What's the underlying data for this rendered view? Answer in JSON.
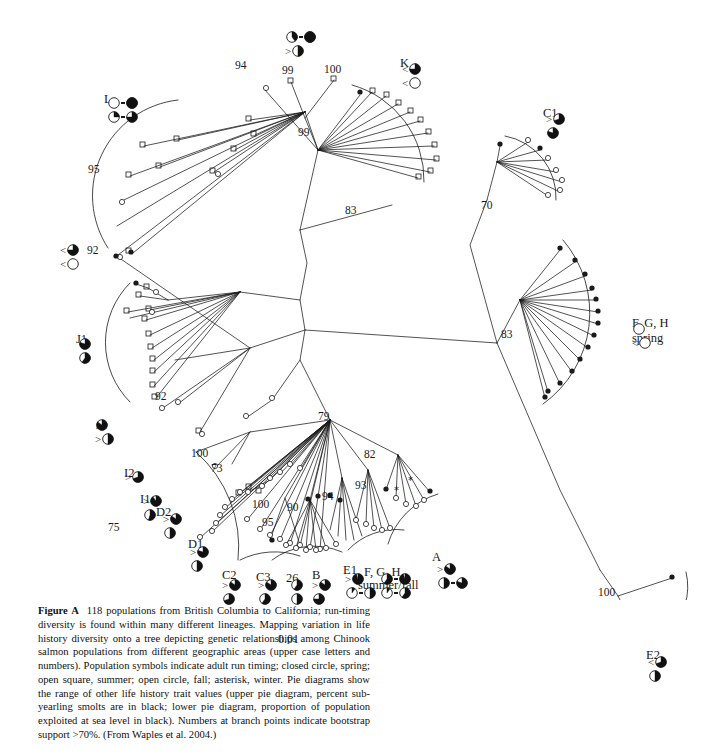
{
  "figure": {
    "label": "Figure A",
    "caption": "118 populations from British Columbia to California; run-timing diversity is found within many different lineages. Mapping variation in life history diversity onto a tree depicting genetic relationships among Chinook salmon populations from different geographic areas (upper case letters and numbers). Population symbols indicate adult run timing; closed circle, spring; open square, summer; open circle, fall; asterisk, winter. Pie diagrams show the range of other life history trait values (upper pie diagram, percent sub-yearling smolts are in black; lower pie diagram, proportion of population exploited at sea level in black). Numbers at branch points indicate bootstrap support >70%. (From Waples et al. 2004.)"
  },
  "scale_bar": {
    "value": "0.01"
  },
  "chart_data": {
    "type": "diagram",
    "subtype": "unrooted-phylogenetic-tree",
    "n_populations": 118,
    "scale_bar": "0.01",
    "bootstrap_threshold": ">70%",
    "symbol_legend": [
      {
        "symbol": "closed circle",
        "meaning": "spring"
      },
      {
        "symbol": "open square",
        "meaning": "summer"
      },
      {
        "symbol": "open circle",
        "meaning": "fall"
      },
      {
        "symbol": "asterisk",
        "meaning": "winter"
      }
    ],
    "pie_legend": [
      {
        "position": "upper pie diagram",
        "meaning": "percent sub-yearling smolts are in black"
      },
      {
        "position": "lower pie diagram",
        "meaning": "proportion of population exploited at sea level in black"
      }
    ],
    "bootstrap_values": [
      94,
      99,
      100,
      99,
      95,
      92,
      83,
      70,
      83,
      92,
      79,
      100,
      73,
      75,
      100,
      95,
      90,
      94,
      93,
      82,
      26,
      100
    ],
    "clades": [
      {
        "name": "L",
        "x": 107,
        "y": 96,
        "pies": [
          [
            0.0,
            1.0
          ],
          [
            0.25,
            0.75
          ]
        ],
        "lt": [
          "",
          ""
        ],
        "paired": true
      },
      {
        "name": "",
        "x": 285,
        "y": 30,
        "pies": [
          [
            0.4,
            1.0
          ],
          [
            0.5,
            null
          ]
        ],
        "lt": [
          "",
          ">"
        ],
        "paired": true
      },
      {
        "name": "K",
        "x": 402,
        "y": 62,
        "pies": [
          [
            0.75,
            null
          ],
          [
            0.0,
            null
          ]
        ],
        "lt": [
          "<",
          "<"
        ],
        "paired": false
      },
      {
        "name": "C1",
        "x": 546,
        "y": 112,
        "pies": [
          [
            0.7,
            null
          ],
          [
            0.8,
            null
          ]
        ],
        "lt": [
          ">",
          ""
        ],
        "paired": false
      },
      {
        "name": "",
        "x": 60,
        "y": 243,
        "pies": [
          [
            0.75,
            null
          ],
          [
            0.0,
            null
          ]
        ],
        "lt": [
          "<",
          "<"
        ],
        "paired": false
      },
      {
        "name": "J1",
        "x": 78,
        "y": 337,
        "pies": [
          [
            0.8,
            null
          ],
          [
            0.6,
            null
          ]
        ],
        "lt": [
          "",
          ""
        ],
        "paired": false
      },
      {
        "name": "J2",
        "x": 95,
        "y": 418,
        "pies": [
          [
            0.85,
            null
          ],
          [
            0.5,
            null
          ]
        ],
        "lt": [
          "",
          ">"
        ],
        "paired": false
      },
      {
        "name": "F, G, H spring",
        "x": 632,
        "y": 322,
        "pies": [
          [
            0.0,
            null
          ],
          [
            0.0,
            null
          ]
        ],
        "lt": [
          "",
          "<"
        ],
        "paired": false
      },
      {
        "name": "I2",
        "x": 125,
        "y": 470,
        "pies": [
          [
            0.7,
            null
          ]
        ],
        "lt": [
          ">"
        ],
        "paired": false
      },
      {
        "name": "I1",
        "x": 143,
        "y": 494,
        "pies": [
          [
            0.9,
            null
          ],
          [
            0.55,
            null
          ]
        ],
        "lt": [
          ">",
          ""
        ],
        "paired": false
      },
      {
        "name": "D2",
        "x": 163,
        "y": 512,
        "pies": [
          [
            0.85,
            null
          ],
          [
            0.5,
            null
          ]
        ],
        "lt": [
          ">",
          ""
        ],
        "paired": false
      },
      {
        "name": "D1",
        "x": 190,
        "y": 545,
        "pies": [
          [
            0.8,
            null
          ],
          [
            0.5,
            null
          ]
        ],
        "lt": [
          ">",
          ""
        ],
        "paired": false
      },
      {
        "name": "C2",
        "x": 222,
        "y": 578,
        "pies": [
          [
            0.85,
            null
          ],
          [
            0.7,
            null
          ]
        ],
        "lt": [
          ">",
          ""
        ],
        "paired": false
      },
      {
        "name": "C3",
        "x": 258,
        "y": 578,
        "pies": [
          [
            0.85,
            null
          ],
          [
            0.6,
            null
          ]
        ],
        "lt": [
          ">",
          ""
        ],
        "paired": false
      },
      {
        "name": "26",
        "x": 290,
        "y": 578,
        "pies": [
          [
            0.6,
            null
          ],
          [
            0.5,
            null
          ]
        ],
        "lt": [
          "",
          ""
        ],
        "paired": false
      },
      {
        "name": "B",
        "x": 312,
        "y": 578,
        "pies": [
          [
            0.85,
            null
          ],
          [
            0.75,
            null
          ]
        ],
        "lt": [
          ">",
          ""
        ],
        "paired": false
      },
      {
        "name": "E1",
        "x": 345,
        "y": 572,
        "pies": [
          [
            0.95,
            null
          ],
          [
            0.1,
            0.5
          ]
        ],
        "lt": [
          ">",
          ""
        ],
        "paired": true
      },
      {
        "name": "F, G, H summer/fall",
        "x": 380,
        "y": 572,
        "pies": [
          [
            0.6,
            0.95
          ],
          [
            0.1,
            0.6
          ]
        ],
        "lt": [
          "",
          ""
        ],
        "paired": true
      },
      {
        "name": "A",
        "x": 437,
        "y": 562,
        "pies": [
          [
            0.85,
            null
          ],
          [
            0.5,
            0.8
          ]
        ],
        "lt": [
          ">",
          ""
        ],
        "paired": true
      },
      {
        "name": "E2",
        "x": 648,
        "y": 655,
        "pies": [
          [
            0.7,
            null
          ],
          [
            0.5,
            null
          ]
        ],
        "lt": [
          "<",
          ""
        ],
        "paired": false
      }
    ]
  },
  "clade_labels": {
    "L": "L",
    "K": "K",
    "C1": "C1",
    "J1": "J1",
    "J2": "J2",
    "I2": "I2",
    "I1": "I1",
    "D2": "D2",
    "D1": "D1",
    "C2": "C2",
    "C3": "C3",
    "n26": "26",
    "B": "B",
    "E1": "E1",
    "A": "A",
    "E2": "E2",
    "fgh_spring_1": "F, G, H",
    "fgh_spring_2": "spring",
    "fgh_sf_1": "F, G, H",
    "fgh_sf_2": "summer/fall"
  },
  "bootstrap_labels": {
    "b94": "94",
    "b99a": "99",
    "b100a": "100",
    "b99b": "99",
    "b95a": "95",
    "b92a": "92",
    "b83a": "83",
    "b70": "70",
    "b83b": "83",
    "b92b": "92",
    "b79": "79",
    "b100b": "100",
    "b73": "73",
    "b75": "75",
    "b100c": "100",
    "b95b": "95",
    "b90": "90",
    "b94b": "94",
    "b93": "93",
    "b82": "82",
    "b100d": "100"
  }
}
